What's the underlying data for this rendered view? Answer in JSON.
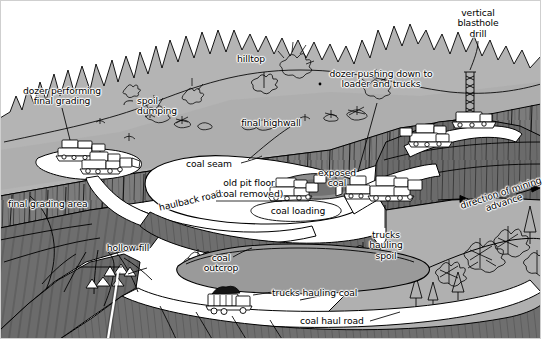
{
  "figure": {
    "type": "line-art diagram",
    "canvas": {
      "width": 555,
      "height": 355
    }
  },
  "palette": {
    "sky": "#ffffff",
    "forest_hill": "#b3b3b3",
    "spoil_slope": "#8a8a8a",
    "dark_slope": "#6f6f6f",
    "highwall_rock": "#7d7d7d",
    "coal_black": "#1a1a1a",
    "coal_bed_gray": "#9a9a9a",
    "bench_white": "#ffffff",
    "outline": "#000000",
    "paper": "#ffffff"
  },
  "labels": [
    {
      "id": "dozer-final-grading",
      "text": "dozer performing\nfinal grading",
      "align": "center"
    },
    {
      "id": "spoil-dumping",
      "text": "spoil\ndumping",
      "align": "left"
    },
    {
      "id": "hilltop",
      "text": "hilltop",
      "align": "center"
    },
    {
      "id": "final-highwall",
      "text": "final highwall",
      "align": "center"
    },
    {
      "id": "dozer-pushing-down",
      "text": "dozer pushing down to\nloader and trucks",
      "align": "center"
    },
    {
      "id": "vertical-blasthole-drill",
      "text": "vertical\nblasthole\ndrill",
      "align": "center"
    },
    {
      "id": "coal-seam",
      "text": "coal seam",
      "align": "center"
    },
    {
      "id": "old-pit-floor",
      "text": "old pit floor",
      "align": "center"
    },
    {
      "id": "old-pit-floor-sub",
      "text": "(coal removed)",
      "align": "center"
    },
    {
      "id": "exposed-coal",
      "text": "exposed\ncoal",
      "align": "center"
    },
    {
      "id": "final-grading-area",
      "text": "final grading area",
      "align": "left"
    },
    {
      "id": "haulback-road",
      "text": "haulback road",
      "align": "left"
    },
    {
      "id": "coal-loading",
      "text": "coal loading",
      "align": "center"
    },
    {
      "id": "trucks-hauling-spoil",
      "text": "trucks\nhauling\nspoil",
      "align": "center"
    },
    {
      "id": "direction-of-mining-advance",
      "text": "direction of mining\nadvance",
      "align": "center"
    },
    {
      "id": "hollow-fill",
      "text": "hollow fill",
      "align": "center"
    },
    {
      "id": "coal-outcrop",
      "text": "coal\noutcrop",
      "align": "center"
    },
    {
      "id": "trucks-hauling-coal",
      "text": "trucks hauling coal",
      "align": "left"
    },
    {
      "id": "coal-haul-road",
      "text": "coal haul road",
      "align": "left"
    }
  ],
  "annotations": {
    "arrow_symbol": "→",
    "direction_arrow_left": "→",
    "direction_arrow_right": "→"
  }
}
